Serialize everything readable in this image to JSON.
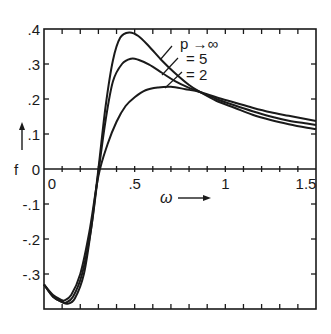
{
  "chart_data": {
    "type": "line",
    "title": "",
    "xlabel": "ω",
    "ylabel": "f",
    "xlim": [
      0,
      1.5
    ],
    "ylim": [
      -0.4,
      0.4
    ],
    "grid": false,
    "x_ticks": [
      "0",
      ".5",
      "1",
      "1.5"
    ],
    "x_tick_values": [
      0,
      0.5,
      1,
      1.5
    ],
    "y_ticks": [
      ".4",
      ".3",
      ".2",
      ".1",
      "0",
      "-.1",
      "-.2",
      "-.3"
    ],
    "y_tick_values": [
      0.4,
      0.3,
      0.2,
      0.1,
      0,
      -0.1,
      -0.2,
      -0.3
    ],
    "minor_tick_step": 0.1,
    "legend": {
      "position": "inline-upper-middle",
      "entries": [
        "p →∞",
        "= 5",
        "= 2"
      ]
    },
    "series": [
      {
        "name": "p →∞",
        "x": [
          0,
          0.05,
          0.1,
          0.13,
          0.17,
          0.22,
          0.26,
          0.3,
          0.34,
          0.38,
          0.42,
          0.47,
          0.52,
          0.58,
          0.65,
          0.72,
          0.8,
          0.86,
          0.95,
          1.05,
          1.15,
          1.25,
          1.35,
          1.45,
          1.5
        ],
        "y": [
          -0.33,
          -0.365,
          -0.38,
          -0.385,
          -0.37,
          -0.3,
          -0.17,
          0.0,
          0.18,
          0.31,
          0.375,
          0.39,
          0.38,
          0.35,
          0.31,
          0.275,
          0.24,
          0.22,
          0.195,
          0.175,
          0.155,
          0.14,
          0.128,
          0.118,
          0.114
        ]
      },
      {
        "name": "p = 5",
        "x": [
          0,
          0.05,
          0.1,
          0.12,
          0.16,
          0.21,
          0.26,
          0.3,
          0.34,
          0.38,
          0.43,
          0.48,
          0.52,
          0.58,
          0.65,
          0.72,
          0.8,
          0.86,
          0.95,
          1.05,
          1.15,
          1.25,
          1.35,
          1.45,
          1.5
        ],
        "y": [
          -0.33,
          -0.365,
          -0.38,
          -0.382,
          -0.365,
          -0.3,
          -0.17,
          -0.01,
          0.14,
          0.25,
          0.3,
          0.315,
          0.312,
          0.298,
          0.275,
          0.252,
          0.232,
          0.22,
          0.2,
          0.182,
          0.165,
          0.15,
          0.138,
          0.13,
          0.126
        ]
      },
      {
        "name": "p = 2",
        "x": [
          0,
          0.05,
          0.1,
          0.11,
          0.15,
          0.2,
          0.25,
          0.3,
          0.35,
          0.4,
          0.45,
          0.5,
          0.56,
          0.63,
          0.7,
          0.78,
          0.86,
          0.95,
          1.05,
          1.15,
          1.25,
          1.35,
          1.45,
          1.5
        ],
        "y": [
          -0.33,
          -0.36,
          -0.375,
          -0.376,
          -0.36,
          -0.3,
          -0.18,
          -0.02,
          0.07,
          0.135,
          0.18,
          0.205,
          0.225,
          0.233,
          0.235,
          0.228,
          0.22,
          0.205,
          0.19,
          0.175,
          0.162,
          0.152,
          0.142,
          0.137
        ]
      }
    ],
    "annotations": [
      "ω →",
      "f ↑"
    ]
  },
  "axes": {
    "y_label": "f",
    "x_label": "ω"
  }
}
